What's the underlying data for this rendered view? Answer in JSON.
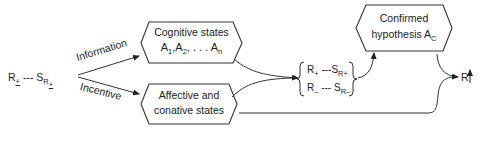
{
  "diagram": {
    "stimulus": {
      "response": "R",
      "response_sign": "+",
      "dashes": "---",
      "stimulus": "S",
      "stimulus_sub": "R",
      "stimulus_sub_sign": "+"
    },
    "branches": {
      "upper_label": "Information",
      "lower_label": "Incentive"
    },
    "cognitive_box": {
      "line1": "Cognitive states",
      "a1": "A",
      "a1_sub": "1",
      "a2": "A",
      "a2_sub": "2",
      "ellipsis": ", . . . ",
      "an": "A",
      "an_sub": "n"
    },
    "affective_box": {
      "line1": "Affective and",
      "line2": "conative states"
    },
    "expectancy_set": {
      "row1_r": "R",
      "row1_r_sign": "+",
      "row1_dashes": "---",
      "row1_s": "S",
      "row1_s_sub": "R",
      "row1_s_sub_sign": "+",
      "row2_r": "R",
      "row2_r_sign": "–",
      "row2_dashes": "---",
      "row2_s": "S",
      "row2_s_sub": "R",
      "row2_s_sub_sign": "–"
    },
    "confirmed_box": {
      "line1": "Confirmed",
      "line2_prefix": "hypothesis A",
      "line2_sub": "C"
    },
    "output": {
      "response": "R",
      "direction_icon": "up-arrow"
    }
  }
}
